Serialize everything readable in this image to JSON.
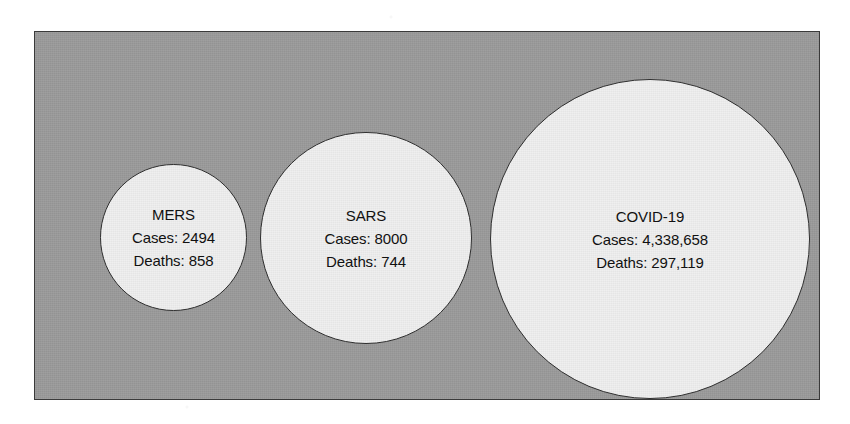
{
  "figure": {
    "type": "bubble-comparison",
    "panel_background_color": "#9a9a9a",
    "panel_border_color": "#3a3a3a",
    "bubble_fill_color": "#eeeeee",
    "bubble_border_color": "#2e2e2e",
    "text_color": "#111111"
  },
  "chart_data": {
    "type": "scatter",
    "title": "",
    "subtitle": "",
    "xlabel": "",
    "ylabel": "",
    "grid": false,
    "legend_position": "none",
    "encoding": "Bubble area scaled to confirmed case counts; each bubble is labeled in place.",
    "categories": [
      "MERS",
      "SARS",
      "COVID-19"
    ],
    "series": [
      {
        "name": "Cases",
        "values": [
          2494,
          8000,
          4338658
        ]
      },
      {
        "name": "Deaths",
        "values": [
          858,
          744,
          297119
        ]
      }
    ],
    "points": [
      {
        "label": "MERS",
        "cases": 2494,
        "deaths": 858,
        "cases_text": "Cases: 2494",
        "deaths_text": "Deaths: 858",
        "diameter_px": 147,
        "center_x_px": 139,
        "center_y_px": 205
      },
      {
        "label": "SARS",
        "cases": 8000,
        "deaths": 744,
        "cases_text": "Cases: 8000",
        "deaths_text": "Deaths: 744",
        "diameter_px": 212,
        "center_x_px": 331,
        "center_y_px": 206
      },
      {
        "label": "COVID-19",
        "cases": 4338658,
        "deaths": 297119,
        "cases_text": "Cases: 4,338,658",
        "deaths_text": "Deaths: 297,119",
        "diameter_px": 320,
        "center_x_px": 615,
        "center_y_px": 207
      }
    ]
  }
}
